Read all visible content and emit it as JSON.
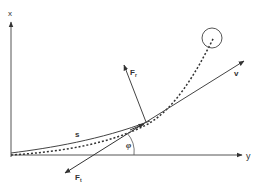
{
  "diagram": {
    "type": "physics-vector-diagram",
    "axes": {
      "vertical_label": "x",
      "horizontal_label": "y"
    },
    "labels": {
      "path": "s",
      "velocity": "v",
      "angle": "φ",
      "radial_force": "F",
      "radial_force_sub": "r",
      "tangential_force": "F",
      "tangential_force_sub": "t"
    },
    "elements": [
      {
        "id": "x-axis",
        "kind": "axis-arrow",
        "label": "x"
      },
      {
        "id": "y-axis",
        "kind": "axis-arrow",
        "label": "y"
      },
      {
        "id": "path-s",
        "kind": "solid-curve",
        "label": "s"
      },
      {
        "id": "dotted-trajectory",
        "kind": "dotted-curve",
        "ends_at": "target-circle"
      },
      {
        "id": "target-circle",
        "kind": "circle"
      },
      {
        "id": "velocity-vector",
        "kind": "arrow",
        "label": "v"
      },
      {
        "id": "radial-force",
        "kind": "arrow",
        "label": "F_r"
      },
      {
        "id": "tangential-force",
        "kind": "arrow",
        "label": "F_t"
      },
      {
        "id": "angle-arc",
        "kind": "arc",
        "label": "φ"
      }
    ],
    "colors": {
      "ink": "#333333",
      "background": "#ffffff"
    }
  }
}
